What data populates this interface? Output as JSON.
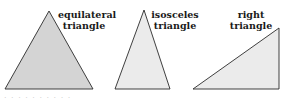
{
  "figure": {
    "triangles": [
      {
        "id": "equilateral",
        "label_line1": "equilateral",
        "label_line2": "triangle",
        "fill": "#d4d4d4",
        "points": "49,11 5,89 93,89"
      },
      {
        "id": "isosceles",
        "label_line1": "isosceles",
        "label_line2": "triangle",
        "fill": "#ebebeb",
        "points": "144,10 115,89 170,89"
      },
      {
        "id": "right",
        "label_line1": "right",
        "label_line2": "triangle",
        "fill": "#ebebeb",
        "points": "193,89 279,28 279,89"
      }
    ],
    "stroke": "#2a2a2a",
    "caption_cutoff": "· · ·  ·  · · · · · ·"
  }
}
